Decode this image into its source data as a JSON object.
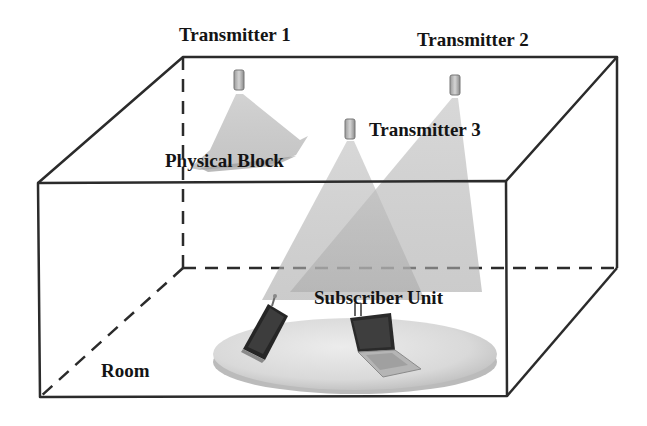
{
  "diagram": {
    "labels": {
      "transmitter_1": "Transmitter 1",
      "transmitter_2": "Transmitter 2",
      "transmitter_3": "Transmitter 3",
      "physical_block": "Physical Block",
      "subscriber_unit": "Subscriber Unit",
      "room": "Room"
    },
    "icons": {
      "transmitter": "transmitter-device-icon",
      "phone": "mobile-phone-icon",
      "laptop": "laptop-icon"
    },
    "colors": {
      "line": "#2b2b2b",
      "beam": "#b8b8b8",
      "disc": "#d6d6d6",
      "device": "#2a2a2a",
      "text": "#141414"
    }
  }
}
